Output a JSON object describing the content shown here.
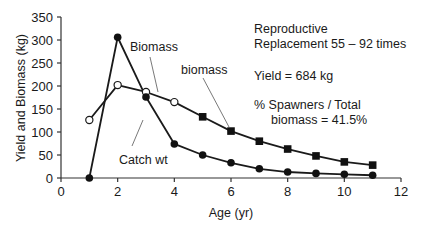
{
  "chart_data": {
    "type": "line",
    "title": "",
    "xlabel": "Age (yr)",
    "ylabel": "Yield and Biomass (kg)",
    "xlim": [
      0,
      12
    ],
    "ylim": [
      0,
      350
    ],
    "x_ticks": [
      0,
      2,
      4,
      6,
      8,
      10,
      12
    ],
    "y_ticks": [
      0,
      50,
      100,
      150,
      200,
      250,
      300,
      350
    ],
    "grid": false,
    "legend": "none (inline labels)",
    "x": [
      1,
      2,
      3,
      4,
      5,
      6,
      7,
      8,
      9,
      10,
      11
    ],
    "series": [
      {
        "name": "Biomass",
        "marker": "open circle (ages 1-4), filled square (ages 5-11, spawner biomass)",
        "values": [
          126,
          202,
          187,
          165,
          133,
          102,
          80,
          63,
          48,
          35,
          28
        ]
      },
      {
        "name": "Catch wt",
        "marker": "filled circle",
        "values": [
          0,
          306,
          176,
          74,
          50,
          33,
          20,
          13,
          10,
          8,
          6
        ]
      }
    ],
    "annotations": [
      "Biomass",
      "biomass",
      "Catch wt",
      "Reproductive",
      "Replacement 55 – 92 times",
      "Yield = 684 kg",
      "% Spawners / Total",
      "biomass = 41.5%"
    ]
  },
  "labels": {
    "xlabel": "Age (yr)",
    "ylabel": "Yield and Biomass (kg)",
    "biomass_upper": "Biomass",
    "biomass_lower": "biomass",
    "catch": "Catch wt",
    "repro_line1": "Reproductive",
    "repro_line2": "Replacement 55 – 92 times",
    "yield": "Yield = 684 kg",
    "spawners_line1": "% Spawners / Total",
    "spawners_line2": "biomass = 41.5%"
  }
}
